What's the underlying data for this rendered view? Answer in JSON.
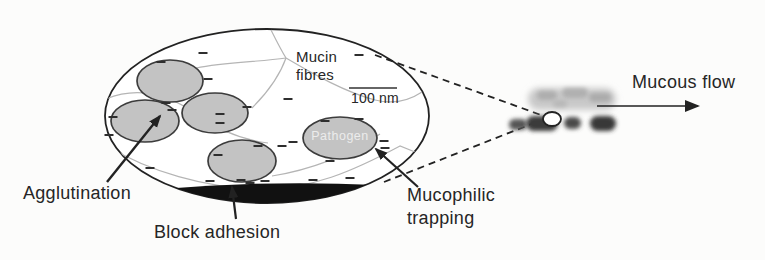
{
  "figure": {
    "labels": {
      "mucin_fibres": "Mucin\nfibres",
      "scale_bar": "100 nm",
      "pathogen": "Pathogen",
      "agglutination": "Agglutination",
      "block_adhesion": "Block adhesion",
      "mucophilic_trapping": "Mucophilic\ntrapping",
      "mucous_flow": "Mucous flow"
    },
    "colors": {
      "background": "#fcfcfb",
      "outline": "#222222",
      "cell_fill": "#c3c3c3",
      "cell_stroke": "#3c3c3c",
      "fibre": "#b5b5b5",
      "minus": "#2e2e2e",
      "arrow": "#222222",
      "crescent": "#111111",
      "text": "#262626",
      "pathogen_text": "#ececec"
    },
    "geometry": {
      "big_ellipse": {
        "cx": 267,
        "cy": 116,
        "rx": 162,
        "ry": 87
      },
      "cells": [
        {
          "name": "bacterium-cell-1",
          "cx": 170,
          "cy": 81,
          "rx": 33,
          "ry": 21
        },
        {
          "name": "bacterium-cell-2",
          "cx": 215,
          "cy": 113,
          "rx": 33,
          "ry": 20
        },
        {
          "name": "bacterium-cell-3",
          "cx": 145,
          "cy": 121,
          "rx": 34,
          "ry": 21
        },
        {
          "name": "bacterium-cell-4",
          "cx": 242,
          "cy": 161,
          "rx": 34,
          "ry": 21
        },
        {
          "name": "pathogen-cell",
          "cx": 340,
          "cy": 138,
          "rx": 37,
          "ry": 21
        }
      ],
      "fibres": [
        "M271,30 C277,42 281,50 286,58",
        "M286,58 C258,62 225,62 196,68 C180,71 172,74 165,78",
        "M286,58 C315,75 345,92 375,100 C395,105 410,100 422,92",
        "M286,58 C280,75 268,92 252,108",
        "M106,99 C138,86 168,94 196,114 C218,130 244,140 268,143",
        "M109,147 C150,172 205,187 255,189 C310,191 355,170 400,146 L415,152",
        "M380,134 C350,155 310,170 272,176"
      ],
      "minus_signs": [
        [
          203,
          53
        ],
        [
          359,
          55
        ],
        [
          161,
          62
        ],
        [
          208,
          79
        ],
        [
          288,
          99
        ],
        [
          166,
          103
        ],
        [
          172,
          110
        ],
        [
          113,
          117
        ],
        [
          109,
          135
        ],
        [
          220,
          114
        ],
        [
          220,
          123
        ],
        [
          247,
          107
        ],
        [
          150,
          168
        ],
        [
          258,
          146
        ],
        [
          282,
          146
        ],
        [
          210,
          181
        ],
        [
          241,
          180
        ],
        [
          265,
          181
        ],
        [
          313,
          180
        ],
        [
          350,
          178
        ],
        [
          325,
          121
        ],
        [
          359,
          119
        ],
        [
          293,
          142
        ],
        [
          330,
          161
        ],
        [
          384,
          141
        ],
        [
          385,
          148
        ],
        [
          218,
          155
        ],
        [
          250,
          183
        ]
      ],
      "crescent": "M162,189 Q268,180 377,185 Q268,224 162,189 Z",
      "scale_bar": {
        "x1": 349,
        "x2": 397,
        "y": 88
      },
      "arrows": [
        {
          "name": "agglutination-arrow",
          "x1": 107,
          "y1": 182,
          "x2": 160,
          "y2": 116,
          "w": 2.4,
          "head": "S"
        },
        {
          "name": "block-adhesion-arrow",
          "x1": 236,
          "y1": 219,
          "x2": 232,
          "y2": 187,
          "w": 2.2,
          "head": "S"
        },
        {
          "name": "mucophilic-trapping-arrow",
          "x1": 418,
          "y1": 187,
          "x2": 376,
          "y2": 149,
          "w": 2.2,
          "head": "S"
        },
        {
          "name": "mucous-flow-arrow",
          "x1": 597,
          "y1": 106,
          "x2": 698,
          "y2": 106,
          "w": 1.5,
          "head": "B"
        }
      ],
      "dashed_lines": [
        {
          "x1": 375,
          "y1": 55,
          "x2": 541,
          "y2": 115
        },
        {
          "x1": 384,
          "y1": 182,
          "x2": 534,
          "y2": 123
        }
      ],
      "micrograph": {
        "blobs": [
          {
            "x": 528,
            "y": 88,
            "w": 88,
            "h": 22,
            "color": "#c9c9c9",
            "blur": "b3"
          },
          {
            "x": 537,
            "y": 91,
            "w": 20,
            "h": 9,
            "color": "#adadad",
            "blur": "b2"
          },
          {
            "x": 562,
            "y": 88,
            "w": 26,
            "h": 10,
            "color": "#b0b0b0",
            "blur": "b2"
          },
          {
            "x": 589,
            "y": 93,
            "w": 22,
            "h": 9,
            "color": "#ababab",
            "blur": "b2"
          },
          {
            "x": 553,
            "y": 100,
            "w": 14,
            "h": 7,
            "color": "#b8b8b8",
            "blur": "b2"
          },
          {
            "x": 509,
            "y": 119,
            "w": 18,
            "h": 11,
            "color": "#555555",
            "blur": "b2"
          },
          {
            "x": 526,
            "y": 116,
            "w": 32,
            "h": 15,
            "color": "#3a3a3a",
            "blur": "b2"
          },
          {
            "x": 564,
            "y": 117,
            "w": 17,
            "h": 12,
            "color": "#4a4a4a",
            "blur": "b2"
          },
          {
            "x": 590,
            "y": 116,
            "w": 26,
            "h": 15,
            "color": "#383838",
            "blur": "b2"
          }
        ],
        "vesicle": {
          "cx": 552,
          "cy": 119,
          "rx": 9,
          "ry": 7
        }
      }
    }
  }
}
